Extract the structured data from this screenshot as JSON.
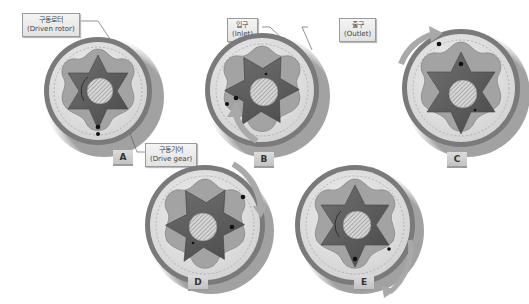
{
  "callouts": {
    "driven_rotor": {
      "ko": "구동로터",
      "en": "(Driven rotor)"
    },
    "drive_gear": {
      "ko": "구동기어",
      "en": "(Drive gear)"
    },
    "inlet": {
      "ko": "입구",
      "en": "(Inlet)"
    },
    "outlet": {
      "ko": "출구",
      "en": "(Outlet)"
    }
  },
  "stages": [
    {
      "label": "A",
      "cx": 95,
      "cy": 88,
      "r": 54
    },
    {
      "label": "B",
      "cx": 262,
      "cy": 90,
      "r": 57
    },
    {
      "label": "C",
      "cx": 460,
      "cy": 87,
      "r": 59
    },
    {
      "label": "D",
      "cx": 205,
      "cy": 225,
      "r": 60
    },
    {
      "label": "E",
      "cx": 355,
      "cy": 225,
      "r": 60
    }
  ],
  "colors": {
    "outer_ring": "#7a7a7a",
    "housing": "#d8d8d8",
    "rotor": "#8c8c8c",
    "gear": "#5e5e5e",
    "shaft": "#c8c8c8",
    "arrow": "#a9a9a9",
    "tag_bg": "#cfcfcf"
  }
}
